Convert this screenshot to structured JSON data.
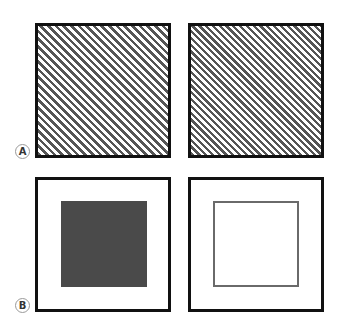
{
  "figure": {
    "panels": [
      {
        "label": "A",
        "items": [
          {
            "name": "wide-stripe-square",
            "pattern": "diagonal stripes (wider spacing)"
          },
          {
            "name": "narrow-stripe-square",
            "pattern": "diagonal stripes (narrower spacing)"
          }
        ]
      },
      {
        "label": "B",
        "items": [
          {
            "name": "filled-inner-square",
            "pattern": "solid dark inner square"
          },
          {
            "name": "outlined-inner-square",
            "pattern": "outlined inner square"
          }
        ]
      }
    ],
    "colors": {
      "frame": "#111111",
      "stripe": "#555555",
      "fill": "#4a4a4a",
      "outline": "#6a6a6a"
    }
  }
}
